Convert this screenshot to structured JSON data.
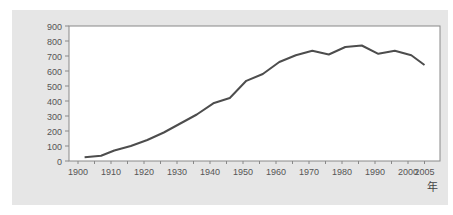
{
  "chart_data": {
    "type": "line",
    "title": "",
    "xlabel": "年",
    "ylabel": "",
    "ylim": [
      0,
      900
    ],
    "xlim": [
      1900,
      2005
    ],
    "grid": false,
    "legend": null,
    "y_ticks": [
      0,
      100,
      200,
      300,
      400,
      500,
      600,
      700,
      800,
      900
    ],
    "x_ticks": [
      1900,
      1910,
      1920,
      1930,
      1940,
      1950,
      1960,
      1970,
      1980,
      1990,
      2000,
      2005
    ],
    "x": [
      1902,
      1907,
      1911,
      1916,
      1921,
      1926,
      1931,
      1936,
      1941,
      1946,
      1951,
      1956,
      1961,
      1966,
      1971,
      1976,
      1981,
      1986,
      1991,
      1996,
      2001,
      2005
    ],
    "values": [
      25,
      35,
      70,
      100,
      140,
      190,
      250,
      310,
      385,
      420,
      535,
      580,
      660,
      705,
      735,
      710,
      760,
      770,
      715,
      735,
      705,
      640
    ],
    "colors": {
      "line": "#4d4d4d",
      "panel": "#e6e6e6",
      "plot_bg": "#ffffff",
      "axis": "#888888"
    }
  },
  "labels": {
    "x_unit": "年"
  }
}
